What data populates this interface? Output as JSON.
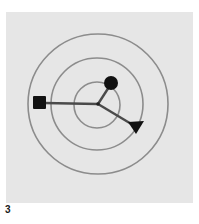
{
  "figure": {
    "label": "3",
    "colors": {
      "background": "#ffffff",
      "panel": "#e6e6e6",
      "rings": "#8c8c8c",
      "spokes": "#4a4a4a",
      "markers": "#111111"
    },
    "center": [
      98,
      104
    ],
    "rings": [
      {
        "name": "inner-ring",
        "radius": 23
      },
      {
        "name": "middle-ring",
        "radius": 46
      },
      {
        "name": "outer-ring",
        "radius": 70
      }
    ],
    "spokes": [
      {
        "name": "square-spoke",
        "marker": "square",
        "end": [
          39,
          103
        ]
      },
      {
        "name": "circle-spoke",
        "marker": "circle",
        "end": [
          111,
          83
        ]
      },
      {
        "name": "triangle-spoke",
        "marker": "triangle",
        "end": [
          135,
          127
        ]
      }
    ]
  }
}
